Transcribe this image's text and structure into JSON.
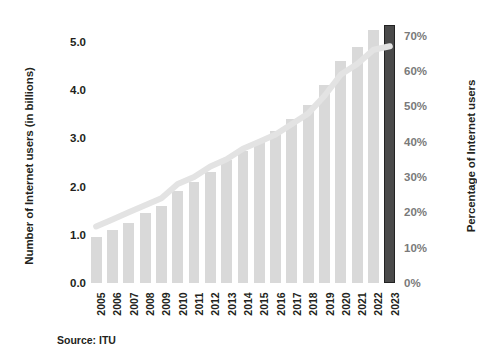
{
  "chart_data": {
    "type": "bar",
    "title": "",
    "subtitle": "",
    "xlabel": "",
    "ylabel": "Number of Internet users (in billions)",
    "y2label": "Percentage of Internet users",
    "grid": false,
    "legend": "none",
    "ylim": [
      0.0,
      5.5
    ],
    "y2lim": [
      0,
      75
    ],
    "categories": [
      "2005",
      "2006",
      "2007",
      "2008",
      "2009",
      "2010",
      "2011",
      "2012",
      "2013",
      "2014",
      "2015",
      "2016",
      "2017",
      "2018",
      "2019",
      "2020",
      "2021",
      "2022",
      "2023"
    ],
    "series": [
      {
        "name": "Number of Internet users (in billions)",
        "type": "bar",
        "unit": "billions",
        "color": "#d9d9d9",
        "highlight_color": "#4a4a4a",
        "highlight_category": "2023",
        "values": [
          0.95,
          1.1,
          1.25,
          1.45,
          1.6,
          1.9,
          2.1,
          2.3,
          2.55,
          2.75,
          2.95,
          3.15,
          3.4,
          3.7,
          4.1,
          4.6,
          4.9,
          5.25,
          5.35
        ]
      },
      {
        "name": "Percentage of Internet users",
        "type": "line",
        "unit": "percent",
        "color": "#e3e3e3",
        "values": [
          16,
          18,
          20,
          22,
          24,
          28,
          30,
          33,
          35,
          38,
          40,
          42,
          45,
          48,
          53,
          59,
          62,
          66,
          67
        ]
      }
    ],
    "y_ticks_left": [
      "0.0",
      "1.0",
      "2.0",
      "3.0",
      "4.0",
      "5.0"
    ],
    "y_ticks_left_values": [
      0.0,
      1.0,
      2.0,
      3.0,
      4.0,
      5.0
    ],
    "y_ticks_right": [
      "0%",
      "10%",
      "20%",
      "30%",
      "40%",
      "50%",
      "60%",
      "70%"
    ],
    "y_ticks_right_values": [
      0,
      10,
      20,
      30,
      40,
      50,
      60,
      70
    ],
    "source": "Source: ITU"
  },
  "colors": {
    "background": "#ffffff",
    "bar": "#d9d9d9",
    "bar_highlight": "#4a4a4a",
    "bar_highlight_border": "#222222",
    "line": "#e3e3e3",
    "text": "#231f20",
    "right_tick_text": "#7a7a7a"
  }
}
